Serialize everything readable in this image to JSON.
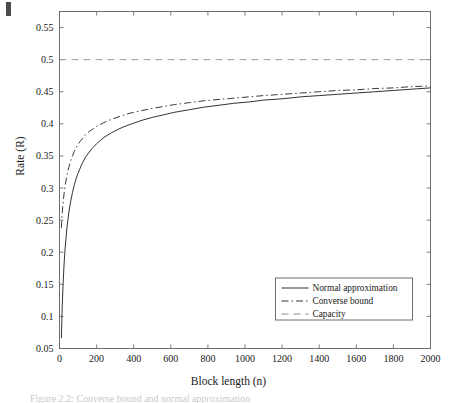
{
  "figure": {
    "xlabel": "Block length (n)",
    "ylabel": "Rate (R)",
    "caption": "Figure 2.2:  Converse bound and normal approximation"
  },
  "chart_data": {
    "type": "line",
    "title": "",
    "xlabel": "Block length (n)",
    "ylabel": "Rate (R)",
    "xlim": [
      0,
      2000
    ],
    "ylim": [
      0.05,
      0.575
    ],
    "grid": false,
    "legend_position": "lower right",
    "xticks": [
      0,
      200,
      400,
      600,
      800,
      1000,
      1200,
      1400,
      1600,
      1800,
      2000
    ],
    "xtick_labels": [
      "0",
      "200",
      "400",
      "600",
      "800",
      "1000",
      "1200",
      "1400",
      "1600",
      "1800",
      "2000"
    ],
    "yticks": [
      0.05,
      0.1,
      0.15,
      0.2,
      0.25,
      0.3,
      0.35,
      0.4,
      0.45,
      0.5,
      0.55
    ],
    "ytick_labels": [
      "0.05",
      "0.1",
      "0.15",
      "0.2",
      "0.25",
      "0.3",
      "0.35",
      "0.4",
      "0.45",
      "0.5",
      "0.55"
    ],
    "series": [
      {
        "name": "Normal approximation",
        "style": "solid",
        "color": "#333333",
        "x": [
          10,
          15,
          20,
          25,
          30,
          40,
          50,
          60,
          70,
          80,
          90,
          100,
          120,
          140,
          160,
          180,
          200,
          240,
          280,
          320,
          360,
          400,
          450,
          500,
          560,
          620,
          700,
          780,
          860,
          940,
          1020,
          1100,
          1200,
          1300,
          1400,
          1500,
          1600,
          1700,
          1800,
          1900,
          2000
        ],
        "y": [
          0.066,
          0.118,
          0.155,
          0.183,
          0.205,
          0.238,
          0.261,
          0.279,
          0.293,
          0.305,
          0.315,
          0.323,
          0.337,
          0.348,
          0.356,
          0.363,
          0.369,
          0.379,
          0.386,
          0.392,
          0.397,
          0.401,
          0.406,
          0.41,
          0.414,
          0.418,
          0.422,
          0.426,
          0.429,
          0.432,
          0.434,
          0.437,
          0.439,
          0.442,
          0.444,
          0.446,
          0.448,
          0.45,
          0.452,
          0.454,
          0.456
        ]
      },
      {
        "name": "Converse bound",
        "style": "dashdot",
        "color": "#3a3a3a",
        "x": [
          10,
          15,
          20,
          25,
          30,
          40,
          50,
          60,
          70,
          80,
          90,
          100,
          120,
          140,
          160,
          180,
          200,
          240,
          280,
          320,
          360,
          400,
          450,
          500,
          560,
          620,
          700,
          780,
          860,
          940,
          1020,
          1100,
          1200,
          1300,
          1400,
          1500,
          1600,
          1700,
          1800,
          1900,
          2000
        ],
        "y": [
          0.238,
          0.262,
          0.279,
          0.292,
          0.303,
          0.32,
          0.332,
          0.342,
          0.35,
          0.357,
          0.363,
          0.368,
          0.376,
          0.383,
          0.388,
          0.392,
          0.396,
          0.402,
          0.407,
          0.411,
          0.415,
          0.418,
          0.421,
          0.424,
          0.427,
          0.43,
          0.433,
          0.436,
          0.438,
          0.44,
          0.442,
          0.444,
          0.446,
          0.448,
          0.45,
          0.452,
          0.453,
          0.455,
          0.456,
          0.458,
          0.459
        ]
      },
      {
        "name": "Capacity",
        "style": "dashed",
        "color": "#9a9a9a",
        "x": [
          0,
          2000
        ],
        "y": [
          0.5,
          0.5
        ]
      }
    ],
    "legend": [
      {
        "label": "Normal approximation",
        "style": "solid"
      },
      {
        "label": "Converse bound",
        "style": "dashdot"
      },
      {
        "label": "Capacity",
        "style": "dashed"
      }
    ]
  }
}
